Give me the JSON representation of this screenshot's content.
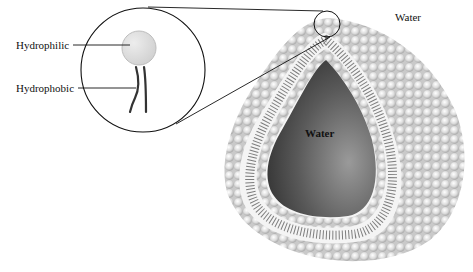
{
  "diagram": {
    "labels": {
      "hydrophilic": "Hydrophilic",
      "hydrophobic": "Hydrophobic",
      "water_outer": "Water",
      "water_inner": "Water"
    },
    "colors": {
      "head": "#d9d9d9",
      "head_edge": "#a8a8a8",
      "tail": "#555555",
      "cavity_dark": "#3a3a3a",
      "cavity_light": "#8a8a8a",
      "bilayer_gap": "#f4f4f4",
      "line": "#111111"
    }
  }
}
